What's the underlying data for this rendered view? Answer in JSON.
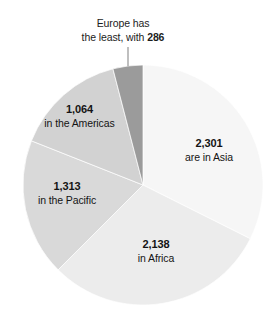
{
  "chart_data": {
    "type": "pie",
    "title": "",
    "subtitle": "",
    "xlabel": "",
    "ylabel": "",
    "legend_position": "none",
    "grid": false,
    "total": 7102,
    "start_angle_deg": 0,
    "direction": "clockwise",
    "categories": [
      "Asia",
      "Africa",
      "Pacific",
      "Americas",
      "Europe"
    ],
    "values": [
      2301,
      2138,
      1313,
      1064,
      286
    ],
    "slices": [
      {
        "name": "Asia",
        "value": 2301,
        "value_text": "2,301",
        "caption": "are in Asia",
        "percent": 32.4,
        "start_deg": 0.0,
        "end_deg": 116.6,
        "color": "#f6f6f6",
        "label_placement": "inside"
      },
      {
        "name": "Africa",
        "value": 2138,
        "value_text": "2,138",
        "caption": "in Africa",
        "percent": 30.1,
        "start_deg": 116.6,
        "end_deg": 225.0,
        "color": "#ececec",
        "label_placement": "inside"
      },
      {
        "name": "Pacific",
        "value": 1313,
        "value_text": "1,313",
        "caption": "in the Pacific",
        "percent": 18.5,
        "start_deg": 225.0,
        "end_deg": 291.6,
        "color": "#d9d9d9",
        "label_placement": "inside"
      },
      {
        "name": "Americas",
        "value": 1064,
        "value_text": "1,064",
        "caption": "in the Americas",
        "percent": 15.0,
        "start_deg": 291.6,
        "end_deg": 345.5,
        "color": "#d2d2d2",
        "label_placement": "inside"
      },
      {
        "name": "Europe",
        "value": 286,
        "value_text": "286",
        "caption": "",
        "percent": 4.0,
        "start_deg": 345.5,
        "end_deg": 360.0,
        "color": "#9b9b9b",
        "label_placement": "callout"
      }
    ],
    "annotations": [
      {
        "target": "Europe",
        "line1": "Europe has",
        "line2_prefix": "the least, with ",
        "line2_value": "286",
        "has_leader_line": true
      }
    ]
  },
  "callout": {
    "line1": "Europe has",
    "line2_prefix": "the least, with ",
    "line2_value": "286"
  },
  "labels": {
    "asia": {
      "value": "2,301",
      "caption": "are in Asia"
    },
    "africa": {
      "value": "2,138",
      "caption": "in Africa"
    },
    "pacific": {
      "value": "1,313",
      "caption": "in the Pacific"
    },
    "americas": {
      "value": "1,064",
      "caption": "in the Americas"
    }
  },
  "colors": {
    "asia": "#f6f6f6",
    "africa": "#ececec",
    "pacific": "#d9d9d9",
    "americas": "#d2d2d2",
    "europe": "#9b9b9b",
    "leader_line": "#8a8a8a",
    "text": "#141414"
  }
}
